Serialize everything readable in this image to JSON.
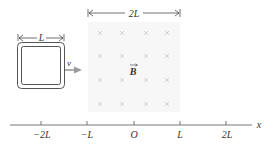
{
  "figure": {
    "field_width_label": "2L",
    "loop_width_label": "L",
    "velocity_label": "v",
    "field_label": "B",
    "axis_label": "x",
    "axis_ticks": [
      "−2L",
      "−L",
      "O",
      "L",
      "2L"
    ],
    "colors": {
      "field_region": "#f7f7f7",
      "field_marks": "#c9c9c9",
      "loop": "#555555",
      "arrow": "#999999",
      "axis": "#555555"
    }
  }
}
